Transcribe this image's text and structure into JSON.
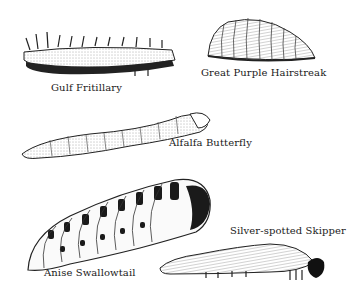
{
  "plate": {
    "caterpillars": [
      {
        "id": "gulf-fritillary",
        "label": "Gulf Fritillary"
      },
      {
        "id": "great-purple-hairstreak",
        "label": "Great Purple Hairstreak"
      },
      {
        "id": "alfalfa-butterfly",
        "label": "Alfalfa Butterfly"
      },
      {
        "id": "anise-swallowtail",
        "label": "Anise Swallowtail"
      },
      {
        "id": "silver-spotted-skipper",
        "label": "Silver-spotted Skipper"
      }
    ]
  },
  "colors": {
    "ink": "#1a1a1a",
    "paper": "#ffffff",
    "shade": "#bdbdbd"
  }
}
